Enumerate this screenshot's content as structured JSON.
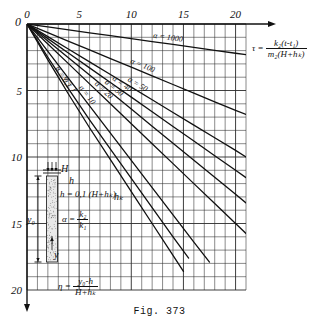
{
  "figure": {
    "caption": "Fig. 373",
    "axes": {
      "x": {
        "position": "top",
        "ticks": [
          0,
          5,
          10,
          15,
          20
        ],
        "tick_labels": [
          "0",
          "5",
          "10",
          "15",
          "20"
        ],
        "range": [
          0,
          21
        ],
        "minor_step": 1
      },
      "y": {
        "position": "left",
        "direction": "downward",
        "ticks": [
          0,
          5,
          10,
          15,
          20
        ],
        "tick_labels": [
          "0",
          "5",
          "10",
          "15",
          "20"
        ],
        "range": [
          0,
          20
        ],
        "minor_step": 1
      },
      "grid": true
    },
    "annotations": {
      "tau_formula": {
        "symbol": "τ",
        "numerator": "k₂(t-t₁)",
        "denominator": "m₂(H+hₖ)"
      },
      "eta_formula": {
        "symbol": "η",
        "numerator": "y₀-h",
        "denominator": "H+hₖ"
      },
      "h_relation": "h = 0,1 (H+hₖ)",
      "alpha_relation": {
        "symbol": "α",
        "numerator": "k₂",
        "denominator": "k₁"
      }
    },
    "inset": {
      "name": "soil-column",
      "labels": [
        "H",
        "h",
        "hₖ",
        "y₀",
        "y"
      ]
    }
  },
  "chart_data": {
    "type": "line",
    "title": "Fig. 373",
    "xlabel": "τ = k₂(t-t₁)/m₂(H+hₖ)",
    "ylabel": "η = (y₀-h)/(H+hₖ)",
    "xlim": [
      0,
      21
    ],
    "ylim": [
      0,
      20
    ],
    "y_inverted": true,
    "grid": true,
    "legend": "inline-curve-labels",
    "series": [
      {
        "name": "α = 1000",
        "label": "α = 1000",
        "x": [
          0,
          2,
          4,
          6,
          8,
          10,
          12,
          14,
          16,
          18,
          20,
          21
        ],
        "values": [
          0,
          0.22,
          0.44,
          0.66,
          0.88,
          1.1,
          1.32,
          1.54,
          1.76,
          1.98,
          2.2,
          2.3
        ]
      },
      {
        "name": "α = 100",
        "label": "α = 100",
        "x": [
          0,
          2,
          4,
          6,
          8,
          10,
          12,
          14,
          16,
          18,
          20,
          21
        ],
        "values": [
          0,
          0.65,
          1.3,
          1.95,
          2.6,
          3.25,
          3.9,
          4.55,
          5.2,
          5.85,
          6.5,
          6.8
        ]
      },
      {
        "name": "α = 50",
        "label": "α = 50",
        "x": [
          0,
          2,
          4,
          6,
          8,
          10,
          12,
          14,
          16,
          18,
          20,
          21
        ],
        "values": [
          0,
          0.95,
          1.9,
          2.85,
          3.8,
          4.75,
          5.7,
          6.65,
          7.6,
          8.55,
          9.5,
          10.0
        ]
      },
      {
        "name": "α = 40",
        "label": "α = 40",
        "x": [
          0,
          2,
          4,
          6,
          8,
          10,
          12,
          14,
          16,
          18,
          20,
          21
        ],
        "values": [
          0,
          1.1,
          2.2,
          3.3,
          4.4,
          5.5,
          6.6,
          7.7,
          8.8,
          9.9,
          11.0,
          11.55
        ]
      },
      {
        "name": "α = 30",
        "label": "α = 30",
        "x": [
          0,
          2,
          4,
          6,
          8,
          10,
          12,
          14,
          16,
          18,
          20,
          21
        ],
        "values": [
          0,
          1.28,
          2.56,
          3.84,
          5.12,
          6.4,
          7.68,
          8.96,
          10.24,
          11.52,
          12.8,
          13.45
        ]
      },
      {
        "name": "α = 20",
        "label": "α = 20",
        "x": [
          0,
          2,
          4,
          6,
          8,
          10,
          12,
          14,
          16,
          18,
          20,
          21
        ],
        "values": [
          0,
          1.5,
          3.0,
          4.5,
          6.0,
          7.5,
          9.0,
          10.5,
          12.0,
          13.5,
          15.0,
          15.75
        ]
      },
      {
        "name": "α = 10",
        "label": "α = 10",
        "x": [
          0,
          2,
          4,
          6,
          8,
          10,
          12,
          14,
          16,
          17.5
        ],
        "values": [
          0,
          2.05,
          4.1,
          6.15,
          8.2,
          10.25,
          12.3,
          14.35,
          16.4,
          17.9
        ]
      },
      {
        "name": "α = 1",
        "label": "α = 1",
        "x": [
          0,
          1,
          2,
          3,
          4,
          6,
          8,
          10,
          12,
          14,
          15.5
        ],
        "values": [
          0,
          1.25,
          2.5,
          3.7,
          4.9,
          7.2,
          9.4,
          11.6,
          13.8,
          16.0,
          17.6
        ]
      },
      {
        "name": "α = 0,1",
        "label": "α = 0,1",
        "x": [
          0,
          1,
          2,
          3,
          4,
          6,
          8,
          10,
          12,
          14,
          15
        ],
        "values": [
          0,
          1.35,
          2.7,
          4.0,
          5.3,
          7.8,
          10.2,
          12.6,
          15.0,
          17.4,
          18.6
        ]
      }
    ]
  }
}
